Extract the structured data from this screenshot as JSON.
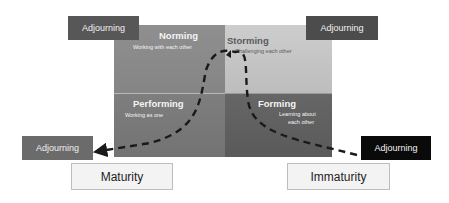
{
  "quadrants": {
    "norming": {
      "title": "Norming",
      "subtitle": "Working with each other"
    },
    "storming": {
      "title": "Storming",
      "subtitle": "Challenging each other"
    },
    "performing": {
      "title": "Performing",
      "subtitle": "Working as one"
    },
    "forming": {
      "title": "Forming",
      "subtitle_line1": "Learning about",
      "subtitle_line2": "each other"
    }
  },
  "adjourning": {
    "top_left": "Adjourning",
    "top_right": "Adjourning",
    "bottom_left": "Adjourning",
    "bottom_right": "Adjourning"
  },
  "axis_labels": {
    "left": "Maturity",
    "right": "Immaturity"
  },
  "colors": {
    "norming": "#8a8a8a",
    "storming": "#c5c5c5",
    "performing": "#787878",
    "forming": "#606060",
    "adjourning_dark": "#555555",
    "adjourning_black": "#0a0a0a",
    "curve": "#1a1a1a"
  }
}
